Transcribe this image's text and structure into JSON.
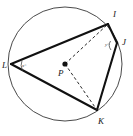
{
  "figure": {
    "kind": "circle-geometry-diagram",
    "colors": {
      "background": "#ffffff",
      "circle_stroke": "#4a4a4a",
      "chord_stroke": "#111111",
      "dashed_stroke": "#2a2a2a",
      "label_fill": "#1a1a1a"
    },
    "circle": {
      "center_label": "P",
      "cx": 65,
      "cy": 64,
      "r": 57
    },
    "center_point": {
      "label": "P",
      "x": 65,
      "y": 64,
      "label_x": 58,
      "label_y": 76
    },
    "vertices": [
      {
        "label": "I",
        "x": 108,
        "y": 24,
        "label_x": 113,
        "label_y": 17
      },
      {
        "label": "J",
        "x": 117,
        "y": 43,
        "label_x": 122,
        "label_y": 45
      },
      {
        "label": "K",
        "x": 97,
        "y": 110,
        "label_x": 98,
        "label_y": 124
      },
      {
        "label": "L",
        "x": 11,
        "y": 64,
        "label_x": 2,
        "label_y": 68
      }
    ],
    "chords": [
      {
        "name": "L-I",
        "from": "L",
        "to": "I"
      },
      {
        "name": "I-J",
        "from": "I",
        "to": "J"
      },
      {
        "name": "J-K",
        "from": "J",
        "to": "K"
      },
      {
        "name": "K-L",
        "from": "K",
        "to": "L"
      }
    ],
    "radii": [
      {
        "name": "P-I",
        "from": "P",
        "to": "I",
        "style": "dashed"
      },
      {
        "name": "P-K",
        "from": "P",
        "to": "K",
        "style": "dashed"
      }
    ],
    "angle_marks": [
      {
        "at": "L",
        "label": "x°",
        "label_x": 22,
        "label_y": 67
      },
      {
        "at": "J",
        "label": "y°",
        "label_x": 105,
        "label_y": 46
      }
    ]
  }
}
